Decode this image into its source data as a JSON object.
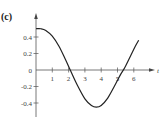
{
  "panel_label": "(c)",
  "chart_data": {
    "type": "line",
    "title": "",
    "xlabel": "t",
    "ylabel": "",
    "xlim": [
      0,
      6.4
    ],
    "ylim": [
      -0.5,
      0.55
    ],
    "x_ticks": [
      1,
      2,
      3,
      4,
      5,
      6
    ],
    "x_tick_labels": [
      "1",
      "2",
      "3",
      "4",
      "5",
      "6"
    ],
    "y_ticks": [
      0.4,
      0.2,
      0,
      -0.2,
      -0.4
    ],
    "y_tick_labels": [
      "0.4",
      "0.2",
      "0",
      "-0.2",
      "-0.4"
    ],
    "grid": false,
    "series": [
      {
        "name": "curve",
        "x": [
          0,
          0.3,
          0.6,
          1.0,
          1.4,
          1.8,
          2.1,
          2.5,
          3.0,
          3.4,
          3.7,
          4.0,
          4.4,
          4.8,
          5.2,
          5.45,
          5.8,
          6.1,
          6.3
        ],
        "y": [
          0.5,
          0.5,
          0.48,
          0.41,
          0.29,
          0.13,
          0.0,
          -0.17,
          -0.35,
          -0.43,
          -0.45,
          -0.43,
          -0.34,
          -0.2,
          -0.05,
          0.03,
          0.17,
          0.29,
          0.36
        ]
      }
    ]
  }
}
